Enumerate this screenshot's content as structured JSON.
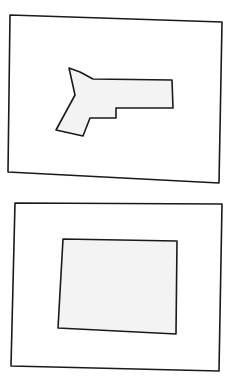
{
  "diagram": {
    "type": "hand-drawn sketch",
    "stroke_color": "#1a1a1a",
    "fill_color": "#f3f3f3",
    "background": "#ffffff",
    "panels": [
      {
        "name": "top-panel",
        "frame_points": "10,15 222,22 219,183 8,172",
        "shape": "pistol-silhouette",
        "shape_points": "69,68 80,72 93,79 172,80 173,108 116,108 116,118 90,118 83,136 56,130 75,95"
      },
      {
        "name": "bottom-panel",
        "frame_points": "15,203 222,204 219,371 11,366",
        "shape": "rectangle",
        "shape_points": "63,239 177,241 176,334 58,328"
      }
    ]
  }
}
